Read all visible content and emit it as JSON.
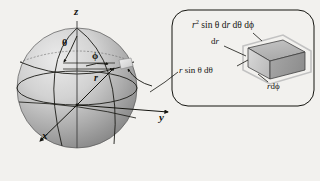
{
  "figure": {
    "title_present": false,
    "background_color": "#f2f1ee",
    "ink_color": "#14140f",
    "sphere": {
      "name": "spherical-coordinate-sphere",
      "center_x": 77,
      "center_y": 88,
      "radius": 60,
      "fill_light": "#e6e6e6",
      "fill_dark": "#8d8d8d"
    },
    "axes": [
      {
        "id": "z",
        "label": "z",
        "label_x": 74,
        "label_y": 10,
        "direction": "up"
      },
      {
        "id": "x",
        "label": "x",
        "label_x": 42,
        "label_y": 131,
        "direction": "lower-left"
      },
      {
        "id": "y",
        "label": "y",
        "label_x": 159,
        "label_y": 114,
        "direction": "lower-right"
      }
    ],
    "angles": [
      {
        "id": "theta",
        "label": "θ",
        "label_x": 64,
        "label_y": 40,
        "meaning": "polar-angle-from-z-axis"
      },
      {
        "id": "phi",
        "label": "ϕ",
        "label_x": 93,
        "label_y": 54,
        "meaning": "azimuthal-angle-in-xy-plane"
      }
    ],
    "radius_label": {
      "id": "r",
      "label": "r",
      "label_x": 95,
      "label_y": 76,
      "meaning": "radial-distance"
    },
    "volume_patch": {
      "name": "volume-element-patch-on-sphere",
      "x": 118,
      "y": 60,
      "w": 14,
      "h": 9,
      "fill": "#dcdcdc"
    }
  },
  "inset": {
    "name": "volume-element-detail",
    "box": {
      "x": 172,
      "y": 10,
      "w": 142,
      "h": 96,
      "radius": 16,
      "stroke": "#14140f",
      "fill": "none"
    },
    "labels": [
      {
        "id": "volume-formula",
        "text_html": "r<sup>2</sup> sin θ dr dθ dϕ",
        "plain": "r² sin θ dr dθ dϕ",
        "x": 192,
        "y": 23
      },
      {
        "id": "dr-label",
        "text_html": "dr",
        "plain": "dr",
        "x": 214,
        "y": 41
      },
      {
        "id": "r-sin-theta-dtheta-label",
        "text_html": "r sin θ dθ",
        "plain": "r sin θ dθ",
        "x": 180,
        "y": 70
      },
      {
        "id": "r-dphi-label",
        "text_html": "rdϕ",
        "plain": "rdϕ",
        "x": 268,
        "y": 86
      }
    ],
    "solid": {
      "name": "parallelepiped-volume-element",
      "face_top": "#b9b9b9",
      "face_front": "#cfcfcf",
      "face_side": "#9e9e9e",
      "outline": "#3a3a3a"
    }
  }
}
